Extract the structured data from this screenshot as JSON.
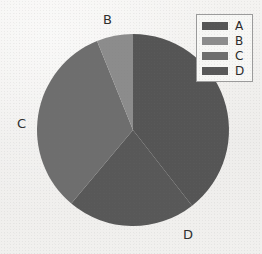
{
  "chart_data": {
    "type": "pie",
    "title": "",
    "categories": [
      "A",
      "B",
      "C",
      "D"
    ],
    "values": [
      39.4,
      6.1,
      32.8,
      21.7
    ],
    "units": "percent",
    "start_angle_deg": 0,
    "direction": "clockwise",
    "slices": [
      {
        "label": "A",
        "value": 39.4,
        "start_deg": 0,
        "end_deg": 142,
        "color": "#555555",
        "outside_label_shown": false
      },
      {
        "label": "D",
        "value": 21.7,
        "start_deg": 142,
        "end_deg": 220,
        "color": "#585858",
        "outside_label_shown": true
      },
      {
        "label": "C",
        "value": 32.8,
        "start_deg": 220,
        "end_deg": 338,
        "color": "#6e6e6e",
        "outside_label_shown": true
      },
      {
        "label": "B",
        "value": 6.1,
        "start_deg": 338,
        "end_deg": 360,
        "color": "#8c8c8c",
        "outside_label_shown": true
      }
    ],
    "legend_position": "top-right",
    "grid": false,
    "xlabel": "",
    "ylabel": ""
  },
  "pie": {
    "center_x": 133,
    "center_y": 130,
    "radius": 96,
    "outside_labels": {
      "b": "B",
      "c": "C",
      "d": "D"
    }
  },
  "legend": {
    "items": [
      {
        "label": "A",
        "color": "#555555"
      },
      {
        "label": "B",
        "color": "#8c8c8c"
      },
      {
        "label": "C",
        "color": "#6e6e6e"
      },
      {
        "label": "D",
        "color": "#585858"
      }
    ]
  },
  "colors": {
    "background": "#f2f1ef",
    "legend_background": "#f7f7f5",
    "legend_border": "#9b9b9b",
    "text": "#2e2e2e"
  }
}
